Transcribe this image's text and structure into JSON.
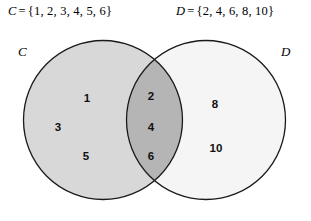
{
  "figure": {
    "type": "venn-diagram",
    "sets": [
      {
        "key": "C",
        "name": "C",
        "definition_label": "C",
        "equals": "=",
        "members_text": "{1, 2, 3, 4, 5, 6}",
        "members": [
          1,
          2,
          3,
          4,
          5,
          6
        ],
        "fill_color": "#d8d8d8"
      },
      {
        "key": "D",
        "name": "D",
        "definition_label": "D",
        "equals": "=",
        "members_text": "{2, 4, 6, 8, 10}",
        "members": [
          2,
          4,
          6,
          8,
          10
        ],
        "fill_color": "#f5f5f5"
      }
    ],
    "regions": {
      "c_only": {
        "name": "C only",
        "values": [
          "1",
          "3",
          "5"
        ],
        "fill_color": "#d8d8d8"
      },
      "intersection": {
        "name": "C and D",
        "values": [
          "2",
          "4",
          "6"
        ],
        "fill_color": "#b5b5b5"
      },
      "d_only": {
        "name": "D only",
        "values": [
          "8",
          "10"
        ],
        "fill_color": "#f5f5f5"
      }
    },
    "outline_color": "#1a1a1a",
    "background_color": "#ffffff"
  }
}
